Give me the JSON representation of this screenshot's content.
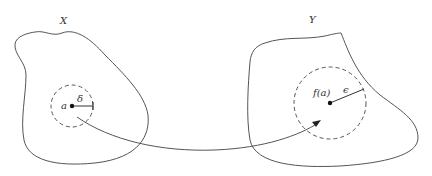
{
  "diagram": {
    "colors": {
      "stroke": "#555555",
      "point": "#111111",
      "text": "#333333",
      "background": "#ffffff"
    },
    "domain_set": {
      "label": "X",
      "point_label": "a",
      "radius_label": "δ"
    },
    "codomain_set": {
      "label": "Y",
      "point_label": "f(a)",
      "radius_label": "ϵ"
    },
    "mapping_arrow": {
      "from": "a",
      "to": "f(a)"
    }
  }
}
